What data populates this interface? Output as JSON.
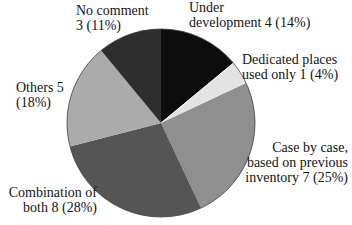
{
  "chart_data": {
    "type": "pie",
    "direction": "clockwise",
    "start_angle_deg": 0,
    "legend": "none (direct labels around pie)",
    "background": "#ffffff",
    "outline_color": "#3f3f3f",
    "slices": [
      {
        "id": "under-development",
        "label": "Under development",
        "count": 4,
        "pct": 14,
        "color": "#0d0d0d"
      },
      {
        "id": "dedicated-places",
        "label": "Dedicated places used only",
        "count": 1,
        "pct": 4,
        "color": "#e3e3e3"
      },
      {
        "id": "case-by-case",
        "label": "Case by case, based on previous inventory",
        "count": 7,
        "pct": 25,
        "color": "#8f8f8f"
      },
      {
        "id": "combination",
        "label": "Combination of both",
        "count": 8,
        "pct": 28,
        "color": "#555555"
      },
      {
        "id": "others",
        "label": "Others",
        "count": 5,
        "pct": 18,
        "color": "#ababab"
      },
      {
        "id": "no-comment",
        "label": "No comment",
        "count": 3,
        "pct": 11,
        "color": "#2e2e2e"
      }
    ]
  },
  "labels": [
    {
      "id": "no-comment",
      "lines": [
        "No comment",
        "3 (11%)"
      ]
    },
    {
      "id": "under-development",
      "lines": [
        "Under",
        "development 4 (14%)"
      ]
    },
    {
      "id": "dedicated-places",
      "lines": [
        "Dedicated places",
        "used only 1 (4%)"
      ]
    },
    {
      "id": "case-by-case",
      "lines": [
        "Case by case,",
        "based on previous",
        "inventory 7 (25%)"
      ]
    },
    {
      "id": "combination",
      "lines": [
        "Combination of",
        "both 8 (28%)"
      ]
    },
    {
      "id": "others",
      "lines": [
        "Others 5",
        "(18%)"
      ]
    }
  ]
}
